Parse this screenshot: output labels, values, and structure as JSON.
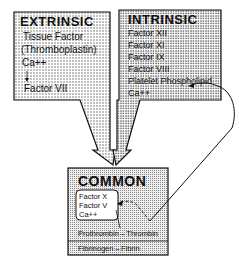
{
  "extrinsic": {
    "title": "EXTRINSIC",
    "items": [
      "Tissue Factor",
      "(Thromboplastin)",
      "Ca++",
      "Factor VII"
    ]
  },
  "intrinsic": {
    "title": "INTRINSIC",
    "items": [
      "Factor XII",
      "Factor XI",
      "Factor IX",
      "Factor VIII",
      "Platelet Phospholipid",
      "Ca++"
    ]
  },
  "common": {
    "title": "COMMON",
    "inner_items": [
      "Factor X",
      "Factor V",
      "Ca++"
    ],
    "reaction1": "Prothrombin→Thrombin",
    "reaction2": "Fibrinogen→Fibrin"
  },
  "colors": {
    "stipple_fill": "#d9d9d9",
    "outline": "#111111",
    "background": "#ffffff"
  }
}
